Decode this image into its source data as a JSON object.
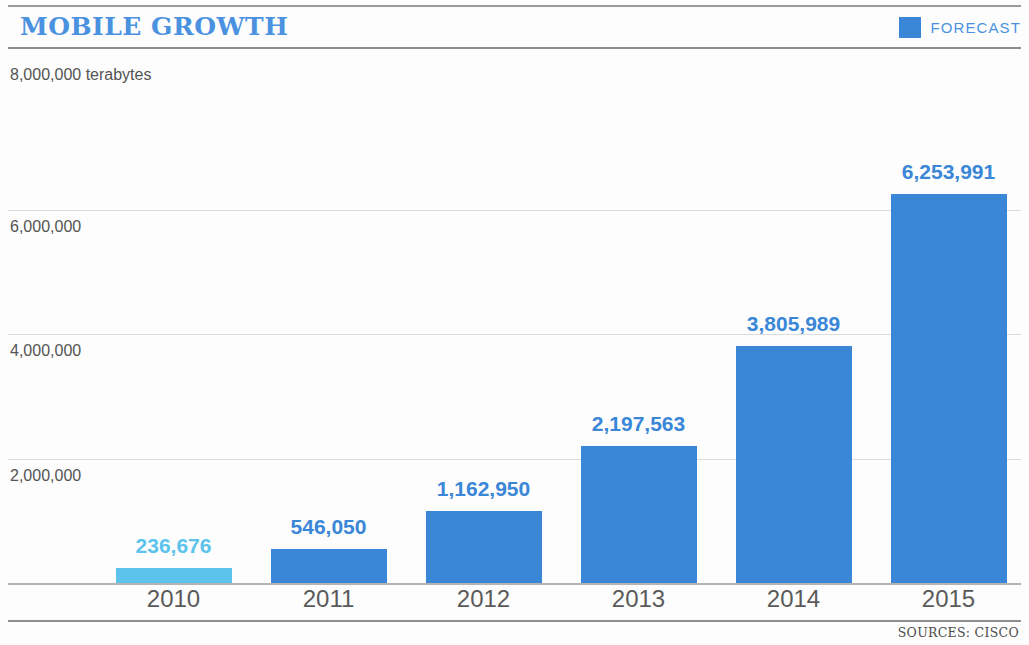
{
  "header": {
    "title": "MOBILE GROWTH",
    "legend": {
      "label": "FORECAST",
      "swatch_color": "#3a87d8"
    }
  },
  "footer": {
    "source": "SOURCES: CISCO"
  },
  "chart_data": {
    "type": "bar",
    "title": "MOBILE GROWTH",
    "xlabel": "",
    "ylabel": "8,000,000 terabytes",
    "unit_caption": "8,000,000 terabytes",
    "categories": [
      "2010",
      "2011",
      "2012",
      "2013",
      "2014",
      "2015"
    ],
    "values": [
      236676,
      546050,
      1162950,
      2197563,
      3805989,
      6253991
    ],
    "value_labels": [
      "236,676",
      "546,050",
      "1,162,950",
      "2,197,563",
      "3,805,989",
      "6,253,991"
    ],
    "ylim": [
      0,
      8000000
    ],
    "ytick_labels": [
      "6,000,000",
      "4,000,000",
      "2,000,000"
    ],
    "ytick_values": [
      6000000,
      4000000,
      2000000
    ],
    "grid": true,
    "legend_position": "top-right",
    "series": [
      {
        "name": "Mobile data traffic (terabytes)",
        "values": [
          236676,
          546050,
          1162950,
          2197563,
          3805989,
          6253991
        ]
      }
    ],
    "bar_colors": [
      "#5bc3ec",
      "#3a87d8",
      "#3a87d8",
      "#3a87d8",
      "#3a87d8",
      "#3a87d8"
    ],
    "actual_color": "#5bc3ec",
    "forecast_color": "#3a87d8"
  }
}
